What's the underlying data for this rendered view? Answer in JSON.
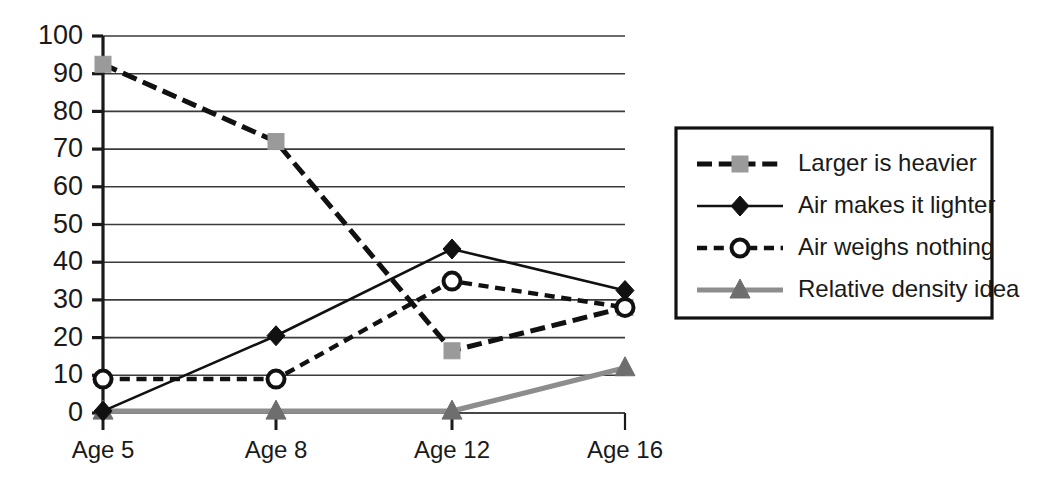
{
  "chart_data": {
    "type": "line",
    "title": "",
    "subtitle": "",
    "xlabel": "",
    "ylabel": "",
    "categories": [
      "Age 5",
      "Age 8",
      "Age 12",
      "Age 16"
    ],
    "ylim": [
      0,
      100
    ],
    "ytick_step": 10,
    "ytick_labels": [
      "0",
      "10",
      "20",
      "30",
      "40",
      "50",
      "60",
      "70",
      "80",
      "90",
      "100"
    ],
    "grid": true,
    "legend_position": "right",
    "series": [
      {
        "name": "Larger is heavier",
        "values": [
          92.5,
          72,
          16.5,
          28
        ],
        "marker": "square",
        "marker_color": "#9a9a9a",
        "line_color": "#111111",
        "line_style": "long-dash",
        "line_width": 5
      },
      {
        "name": "Air makes it lighter",
        "values": [
          0.5,
          20.5,
          43.5,
          32.5
        ],
        "marker": "diamond",
        "marker_color": "#111111",
        "line_color": "#111111",
        "line_style": "solid",
        "line_width": 2.6
      },
      {
        "name": "Air weighs nothing",
        "values": [
          9,
          9,
          35,
          28
        ],
        "marker": "circle-open",
        "marker_color": "#ffffff",
        "line_color": "#111111",
        "line_style": "short-dash",
        "line_width": 4.4
      },
      {
        "name": "Relative density idea",
        "values": [
          0.5,
          0.5,
          0.5,
          12
        ],
        "marker": "triangle",
        "marker_color": "#6e6e6e",
        "line_color": "#8d8d8d",
        "line_style": "solid",
        "line_width": 5.2
      }
    ]
  },
  "axes": {
    "y_labels": [
      "100",
      "90",
      "80",
      "70",
      "60",
      "50",
      "40",
      "30",
      "20",
      "10",
      "0"
    ],
    "x_labels": [
      "Age 5",
      "Age 8",
      "Age 12",
      "Age 16"
    ]
  },
  "legend": {
    "entries": [
      {
        "label": "Larger is heavier"
      },
      {
        "label": "Air makes it lighter"
      },
      {
        "label": "Air weighs nothing"
      },
      {
        "label": "Relative density idea"
      }
    ]
  },
  "colors": {
    "axis": "#1a1a1a",
    "grid": "#3a3a3a",
    "series_gray_square": "#9a9a9a",
    "series_black": "#111111",
    "series_gray_line": "#8d8d8d",
    "series_gray_triangle": "#6e6e6e",
    "background": "#ffffff"
  }
}
